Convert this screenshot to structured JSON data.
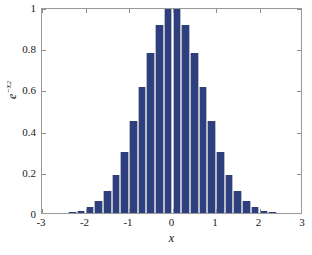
{
  "chart_data": {
    "type": "bar",
    "title": "",
    "subtitle": "",
    "xlabel": "x",
    "ylabel": "e^{-x^2}",
    "ylabel_parts": {
      "base": "e",
      "exponent": "−x",
      "exponent_power": "2"
    },
    "xlim": [
      -3,
      3
    ],
    "ylim": [
      0,
      1
    ],
    "xticks": [
      -3,
      -2,
      -1,
      0,
      1,
      2,
      3
    ],
    "xticklabels": [
      "-3",
      "-2",
      "-1",
      "0",
      "1",
      "2",
      "3"
    ],
    "yticks": [
      0,
      0.2,
      0.4,
      0.6,
      0.8,
      1
    ],
    "yticklabels": [
      "0",
      "0.2",
      "0.4",
      "0.6",
      "0.8",
      "1"
    ],
    "grid": false,
    "legend": null,
    "bar_width": 0.2,
    "bar_color": "#2d3f7f",
    "bar_edge_color": "#b9bcc4",
    "axes_color": "#9a9a9a",
    "background": "#ffffff",
    "categories": [
      -2.5,
      -2.3,
      -2.1,
      -1.9,
      -1.7,
      -1.5,
      -1.3,
      -1.1,
      -0.9,
      -0.7,
      -0.5,
      -0.3,
      -0.1,
      0.1,
      0.3,
      0.5,
      0.7,
      0.9,
      1.1,
      1.3,
      1.5,
      1.7,
      1.9,
      2.1,
      2.3,
      2.5
    ],
    "values": [
      0.0019,
      0.0048,
      0.0117,
      0.0271,
      0.0591,
      0.1054,
      0.1845,
      0.2982,
      0.4449,
      0.6126,
      0.7788,
      0.9139,
      0.99,
      0.99,
      0.9139,
      0.7788,
      0.6126,
      0.4449,
      0.2982,
      0.1845,
      0.1054,
      0.0591,
      0.0271,
      0.0117,
      0.0048,
      0.0019
    ]
  }
}
